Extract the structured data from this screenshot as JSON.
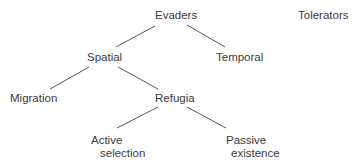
{
  "diagram": {
    "type": "tree",
    "nodes": {
      "evaders": {
        "label": "Evaders"
      },
      "tolerators": {
        "label": "Tolerators"
      },
      "spatial": {
        "label": "Spatial"
      },
      "temporal": {
        "label": "Temporal"
      },
      "migration": {
        "label": "Migration"
      },
      "refugia": {
        "label": "Refugia"
      },
      "active_selection": {
        "line1": "Active",
        "line2": "selection"
      },
      "passive_existence": {
        "line1": "Passive",
        "line2": "existence"
      }
    },
    "edges": [
      {
        "from": "Evaders",
        "to": "Spatial"
      },
      {
        "from": "Evaders",
        "to": "Temporal"
      },
      {
        "from": "Spatial",
        "to": "Migration"
      },
      {
        "from": "Spatial",
        "to": "Refugia"
      },
      {
        "from": "Refugia",
        "to": "Active selection"
      },
      {
        "from": "Refugia",
        "to": "Passive existence"
      }
    ],
    "colors": {
      "text": "#3a3a3a",
      "line": "#555555",
      "background": "#ffffff"
    }
  }
}
